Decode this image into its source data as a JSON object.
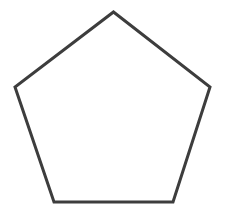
{
  "canvas": {
    "width": 227,
    "height": 216,
    "background_color": "#ffffff"
  },
  "figure": {
    "name": "pentagon",
    "label": "Regular pentagon outline",
    "shape_type": "polygon",
    "sides": 5,
    "fill": "none",
    "fill_color": "#ffffff",
    "stroke_color": "#3d3d3d",
    "stroke_width": 3,
    "stroke_linejoin": "miter",
    "stroke_linecap": "butt",
    "vertices": [
      {
        "name": "apex-top",
        "x": 113.5,
        "y": 12
      },
      {
        "name": "upper-right",
        "x": 210,
        "y": 87
      },
      {
        "name": "lower-right",
        "x": 173,
        "y": 202
      },
      {
        "name": "lower-left",
        "x": 54,
        "y": 202
      },
      {
        "name": "upper-left",
        "x": 15,
        "y": 87
      }
    ],
    "points_attr": "113.5,12 210,87 173,202 54,202 15,87",
    "center": {
      "x": 113.1,
      "y": 118
    },
    "circumradius": 106,
    "rotation_degrees": 0
  }
}
